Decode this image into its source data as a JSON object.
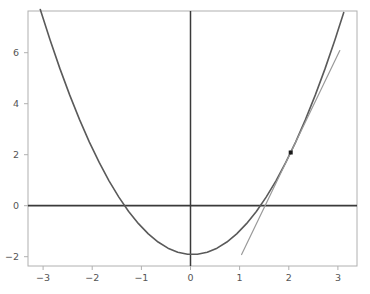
{
  "chart_data": {
    "type": "line",
    "title": "",
    "xlabel": "",
    "ylabel": "",
    "xlim": [
      -3.35,
      3.35
    ],
    "ylim": [
      -2.45,
      7.55
    ],
    "grid": false,
    "legend": null,
    "legend_position": "none",
    "background_color": "#ffffff",
    "frame_color": "#b0b0b0",
    "axis_line_color": "#3a3a3a",
    "xticks": [
      -3,
      -2,
      -1,
      0,
      1,
      2,
      3
    ],
    "xtick_labels": [
      "−3",
      "−2",
      "−1",
      "0",
      "1",
      "2",
      "3"
    ],
    "yticks": [
      -2,
      0,
      2,
      4,
      6
    ],
    "ytick_labels": [
      "−2",
      "0",
      "2",
      "4",
      "6"
    ],
    "series": [
      {
        "name": "parabola",
        "equation": "y = x^2 - 2",
        "color": "#5a5a5a",
        "linewidth": 1.6,
        "x": [
          -3.1,
          -2.9,
          -2.7,
          -2.5,
          -2.3,
          -2.1,
          -1.9,
          -1.7,
          -1.5,
          -1.3,
          -1.1,
          -0.9,
          -0.7,
          -0.5,
          -0.3,
          -0.1,
          0.1,
          0.3,
          0.5,
          0.7,
          0.9,
          1.1,
          1.3,
          1.5,
          1.7,
          1.9,
          2.1,
          2.3,
          2.5,
          2.7,
          2.9,
          3.08
        ],
        "y": [
          7.61,
          6.41,
          5.29,
          4.25,
          3.29,
          2.41,
          1.61,
          0.89,
          0.25,
          -0.31,
          -0.79,
          -1.19,
          -1.51,
          -1.75,
          -1.91,
          -1.99,
          -1.99,
          -1.91,
          -1.75,
          -1.51,
          -1.19,
          -0.79,
          -0.31,
          0.25,
          0.89,
          1.61,
          2.41,
          3.29,
          4.25,
          5.29,
          6.41,
          7.49
        ]
      },
      {
        "name": "tangent-line",
        "equation": "y = 4x - 6",
        "color": "#9a9a9a",
        "linewidth": 1.2,
        "x": [
          1.0,
          3.0
        ],
        "y": [
          -2.0,
          6.0
        ]
      }
    ],
    "points": [
      {
        "name": "tangency-point",
        "x": 2,
        "y": 2,
        "color": "#1a1a1a",
        "marker": "square",
        "size": 4
      }
    ]
  }
}
